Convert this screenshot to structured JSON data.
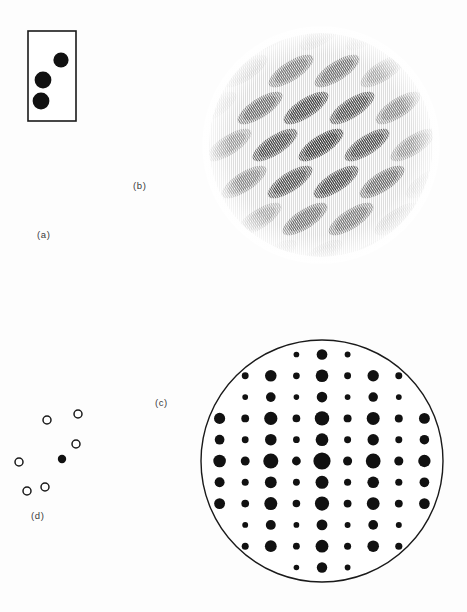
{
  "figure": {
    "caption_labels": {
      "a": "(a)",
      "b": "(b)",
      "c": "(c)",
      "d": "(d)"
    },
    "background_color": "#fdfdfd",
    "ink_color": "#111111"
  },
  "panel_a": {
    "label": "(a)",
    "description": "rectangular outline box containing three filled black discs",
    "box": {
      "x": 28,
      "y": 131,
      "width": 48,
      "height": 90,
      "stroke": "#1a1a1a",
      "stroke_width": 1.6,
      "fill": "#ffffff"
    },
    "spots": [
      {
        "cx": 61,
        "cy": 160,
        "r": 7.6,
        "fill": "#111111"
      },
      {
        "cx": 43,
        "cy": 180,
        "r": 8.4,
        "fill": "#111111"
      },
      {
        "cx": 41,
        "cy": 201,
        "r": 8.4,
        "fill": "#111111"
      }
    ]
  },
  "panel_b": {
    "label": "(b)",
    "description": "circular field of tilted elliptical blobs rendered as fine vertical line screen (moire / optical transform)",
    "disc": {
      "cx": 136,
      "cy": 137,
      "r": 112
    },
    "blob": {
      "rx": 26,
      "ry": 9.5,
      "tilt_deg": -33,
      "fill": "#2a2a2a"
    },
    "lattice": {
      "dx": 46,
      "dy": 37,
      "shear": 15,
      "rows": 9,
      "cols": 8
    },
    "line_screen": {
      "period": 2.0,
      "line_width": 0.85,
      "color": "#151515"
    }
  },
  "panel_c": {
    "label": "(c)",
    "description": "circular diffraction pattern: rectangular lattice of black spots with largest spot at centre",
    "circle": {
      "cx": 137,
      "cy": 141,
      "r": 121,
      "stroke": "#1a1a1a",
      "stroke_width": 1.4,
      "fill": "#ffffff"
    },
    "lattice": {
      "col_spacing": 25.6,
      "row_spacing": 21.3,
      "cols": 11,
      "rows": 13
    },
    "center_spot_radius": 8.6,
    "spot_fill": "#111111",
    "column_intensity": [
      0.55,
      0.78,
      0.45,
      0.88,
      0.4,
      0.95,
      0.42,
      0.86,
      0.46,
      0.76,
      0.52
    ],
    "row_intensity": [
      0.42,
      0.66,
      0.78,
      0.58,
      0.86,
      0.7,
      1.0,
      0.72,
      0.84,
      0.6,
      0.8,
      0.64,
      0.44
    ]
  },
  "panel_d": {
    "label": "(d)",
    "description": "reciprocal lattice schematic: one filled spot surrounded by six open circles",
    "filled_spots": [
      {
        "cx": 62,
        "cy": 459,
        "r": 4.2,
        "fill": "#111111"
      }
    ],
    "open_spots": [
      {
        "cx": 78,
        "cy": 414,
        "r": 4.0
      },
      {
        "cx": 47,
        "cy": 420,
        "r": 4.0
      },
      {
        "cx": 76,
        "cy": 444,
        "r": 4.0
      },
      {
        "cx": 19,
        "cy": 462,
        "r": 4.0
      },
      {
        "cx": 45,
        "cy": 487,
        "r": 4.0
      },
      {
        "cx": 27,
        "cy": 491,
        "r": 4.0
      }
    ],
    "open_stroke": "#1a1a1a",
    "open_stroke_width": 1.5,
    "open_fill": "#ffffff"
  }
}
